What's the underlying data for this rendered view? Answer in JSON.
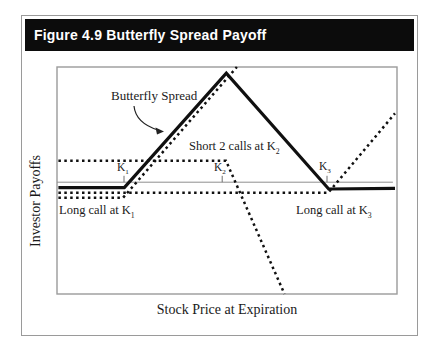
{
  "figure": {
    "title": "Figure 4.9 Butterfly Spread Payoff"
  },
  "chart_data": {
    "type": "line",
    "title": "Figure 4.9 Butterfly Spread Payoff",
    "xlabel": "Stock Price at Expiration",
    "ylabel": "Investor Payoffs",
    "x_range": [
      0,
      100
    ],
    "y_range": [
      -33,
      34
    ],
    "grid": false,
    "axes_numeric": false,
    "strikes": {
      "K1": 20,
      "K2": 50,
      "K3": 80
    },
    "plot_px": {
      "left": 57,
      "top": 67,
      "width": 340,
      "height": 227
    },
    "series": [
      {
        "name": "zero-payoff-line",
        "style": "axis",
        "label": "",
        "points": [
          [
            0,
            0
          ],
          [
            98.8,
            0
          ]
        ]
      },
      {
        "name": "long-call-k1",
        "style": "dotted",
        "label": "Long call at K1",
        "points": [
          [
            0.4,
            -4.6
          ],
          [
            19.4,
            -4.6
          ],
          [
            52.9,
            34
          ]
        ]
      },
      {
        "name": "short-2-calls-k2",
        "style": "dotted",
        "label": "Short 2 calls at K2",
        "points": [
          [
            0.4,
            6.3
          ],
          [
            49.7,
            6.3
          ],
          [
            66.9,
            -33
          ]
        ]
      },
      {
        "name": "long-call-k3",
        "style": "dotted",
        "label": "Long call at K3",
        "points": [
          [
            0.4,
            -3.1
          ],
          [
            79.8,
            -3.1
          ],
          [
            99.4,
            20.3
          ]
        ]
      },
      {
        "name": "butterfly-spread",
        "style": "solid",
        "label": "Butterfly Spread",
        "points": [
          [
            0.4,
            -1.6
          ],
          [
            19.8,
            -1.6
          ],
          [
            49.8,
            32.2
          ],
          [
            79.9,
            -2
          ],
          [
            99.4,
            -1.8
          ]
        ]
      }
    ],
    "ticks": [
      {
        "x": 19.7,
        "h": 1.9
      },
      {
        "x": 48.6,
        "h": 1.9
      },
      {
        "x": 79.4,
        "h": 1.9
      }
    ],
    "arrow": {
      "d": "M134,106 C135,116 142,125 158,130",
      "head": "164,131.5 155.5,127.5 157,134.5"
    },
    "annotations": {
      "butterfly": {
        "text": "Butterfly Spread"
      },
      "short2": {
        "text": "Short 2 calls at K",
        "sub": "2"
      },
      "k1": {
        "text": "K",
        "sub": "1"
      },
      "k2": {
        "text": "K",
        "sub": "2"
      },
      "k3": {
        "text": "K",
        "sub": "3"
      },
      "long_k1": {
        "text": "Long call at K",
        "sub": "1"
      },
      "long_k3": {
        "text": "Long call at K",
        "sub": "3"
      },
      "xlabel": {
        "text": "Stock Price at Expiration"
      },
      "ylabel": {
        "text": "Investor Payoffs"
      }
    }
  }
}
